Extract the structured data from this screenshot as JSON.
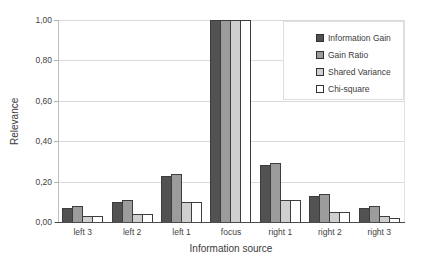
{
  "chart_data": {
    "type": "bar",
    "title": "",
    "xlabel": "Information source",
    "ylabel": "Relevance",
    "categories": [
      "left 3",
      "left 2",
      "left 1",
      "focus",
      "right 1",
      "right 2",
      "right 3"
    ],
    "series": [
      {
        "name": "Information Gain",
        "color": "#525252",
        "values": [
          0.07,
          0.1,
          0.23,
          1.0,
          0.28,
          0.13,
          0.07
        ]
      },
      {
        "name": "Gain Ratio",
        "color": "#9c9c9c",
        "values": [
          0.08,
          0.11,
          0.24,
          1.0,
          0.29,
          0.14,
          0.08
        ]
      },
      {
        "name": "Shared Variance",
        "color": "#cfcfcf",
        "values": [
          0.03,
          0.04,
          0.1,
          1.0,
          0.11,
          0.05,
          0.03
        ]
      },
      {
        "name": "Chi-square",
        "color": "#ffffff",
        "values": [
          0.03,
          0.04,
          0.1,
          1.0,
          0.11,
          0.05,
          0.02
        ]
      }
    ],
    "ylim": [
      0,
      1
    ],
    "yticks": [
      {
        "label": "0,00",
        "value": 0.0
      },
      {
        "label": "0,20",
        "value": 0.2
      },
      {
        "label": "0,40",
        "value": 0.4
      },
      {
        "label": "0,60",
        "value": 0.6
      },
      {
        "label": "0,80",
        "value": 0.8
      },
      {
        "label": "1,00",
        "value": 1.0
      }
    ],
    "grid": true,
    "legend_position": "top-right inside plot",
    "colors": {
      "bar_border": "#3d3d3d",
      "gridline": "#d9d9d9",
      "value_axis_line": "#bdbdbd",
      "category_axis_line": "#4a4a4a",
      "text": "#3f3f3f",
      "background": "#ffffff"
    }
  }
}
